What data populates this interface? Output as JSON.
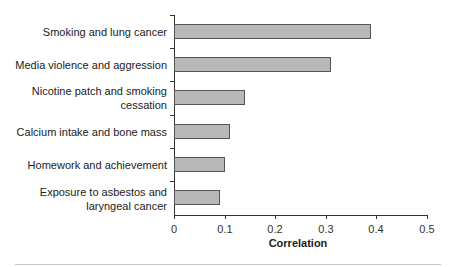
{
  "chart_data": {
    "type": "bar",
    "orientation": "horizontal",
    "title": "",
    "xlabel": "Correlation",
    "ylabel": "",
    "xlim": [
      0,
      0.5
    ],
    "xticks": [
      "0",
      "0.1",
      "0.2",
      "0.3",
      "0.4",
      "0.5"
    ],
    "grid": false,
    "legend": null,
    "categories": [
      "Smoking and lung cancer",
      "Media violence and aggression",
      "Nicotine patch and smoking cessation",
      "Calcium intake and bone mass",
      "Homework and achievement",
      "Exposure to asbestos and laryngeal cancer"
    ],
    "values": [
      0.39,
      0.31,
      0.14,
      0.11,
      0.1,
      0.09
    ],
    "bar_color": "#b8b8b8",
    "bar_edge_color": "#555555"
  },
  "labels": {
    "cat0": "Smoking and lung cancer",
    "cat1": "Media violence and aggression",
    "cat2a": "Nicotine patch and smoking",
    "cat2b": "cessation",
    "cat3": "Calcium intake and bone mass",
    "cat4": "Homework and achievement",
    "cat5a": "Exposure to asbestos and",
    "cat5b": "laryngeal cancer",
    "xlabel": "Correlation",
    "ticks": [
      "0",
      "0.1",
      "0.2",
      "0.3",
      "0.4",
      "0.5"
    ]
  }
}
